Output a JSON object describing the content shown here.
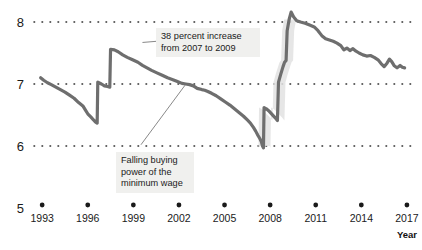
{
  "chart_data": {
    "type": "line",
    "title": "",
    "xlabel": "Year",
    "ylabel": "",
    "xlim": [
      1992.2,
      2017.4
    ],
    "ylim": [
      5,
      8.35
    ],
    "grid": true,
    "grid_style": "dotted-horizontal",
    "legend": "none",
    "line_color": "#6e6e6e",
    "shade_color": "#e2e2e2",
    "y_ticks": [
      "8",
      "7",
      "6",
      "5"
    ],
    "y_tick_values": [
      8,
      7,
      6,
      5
    ],
    "x_ticks": [
      "1993",
      "1996",
      "1999",
      "2002",
      "2005",
      "2008",
      "2011",
      "2014",
      "2017"
    ],
    "x_tick_values": [
      1993,
      1996,
      1999,
      2002,
      2005,
      2008,
      2011,
      2014,
      2017
    ],
    "annotations": [
      {
        "id": "increase",
        "text": "38 percent increase\nfrom 2007 to 2009",
        "leader_from": [
          1999.6,
          7.67
        ],
        "leader_to": [
          2007.0,
          7.82
        ]
      },
      {
        "id": "falling",
        "text": "Falling buying\npower of the\nminimum wage",
        "leader_from": [
          1999.5,
          6.02
        ],
        "leader_to": [
          2002.4,
          6.98
        ]
      }
    ],
    "series": [
      {
        "name": "Real value of federal minimum wage (2017 dollars)",
        "points": [
          [
            1992.9,
            7.1
          ],
          [
            1993.1,
            7.06
          ],
          [
            1993.35,
            7.02
          ],
          [
            1993.6,
            6.99
          ],
          [
            1993.9,
            6.95
          ],
          [
            1994.2,
            6.91
          ],
          [
            1994.5,
            6.87
          ],
          [
            1994.8,
            6.82
          ],
          [
            1995.1,
            6.77
          ],
          [
            1995.4,
            6.7
          ],
          [
            1995.7,
            6.64
          ],
          [
            1995.85,
            6.58
          ],
          [
            1996.0,
            6.52
          ],
          [
            1996.2,
            6.47
          ],
          [
            1996.38,
            6.42
          ],
          [
            1996.5,
            6.39
          ],
          [
            1996.62,
            6.37
          ],
          [
            1996.66,
            7.03
          ],
          [
            1996.9,
            7.0
          ],
          [
            1997.1,
            6.97
          ],
          [
            1997.3,
            6.96
          ],
          [
            1997.45,
            6.95
          ],
          [
            1997.5,
            7.56
          ],
          [
            1997.75,
            7.55
          ],
          [
            1998.0,
            7.52
          ],
          [
            1998.3,
            7.47
          ],
          [
            1998.6,
            7.43
          ],
          [
            1998.95,
            7.39
          ],
          [
            1999.3,
            7.35
          ],
          [
            1999.6,
            7.3
          ],
          [
            1999.9,
            7.26
          ],
          [
            2000.2,
            7.22
          ],
          [
            2000.55,
            7.18
          ],
          [
            2000.9,
            7.14
          ],
          [
            2001.25,
            7.1
          ],
          [
            2001.6,
            7.07
          ],
          [
            2001.9,
            7.04
          ],
          [
            2002.2,
            7.01
          ],
          [
            2002.45,
            7.0
          ],
          [
            2002.7,
            6.99
          ],
          [
            2002.95,
            6.97
          ],
          [
            2003.2,
            6.93
          ],
          [
            2003.5,
            6.91
          ],
          [
            2003.7,
            6.9
          ],
          [
            2003.9,
            6.88
          ],
          [
            2004.15,
            6.85
          ],
          [
            2004.45,
            6.81
          ],
          [
            2004.75,
            6.76
          ],
          [
            2005.05,
            6.71
          ],
          [
            2005.35,
            6.66
          ],
          [
            2005.65,
            6.6
          ],
          [
            2005.95,
            6.54
          ],
          [
            2006.25,
            6.48
          ],
          [
            2006.5,
            6.42
          ],
          [
            2006.7,
            6.37
          ],
          [
            2006.9,
            6.3
          ],
          [
            2007.05,
            6.24
          ],
          [
            2007.2,
            6.17
          ],
          [
            2007.32,
            6.12
          ],
          [
            2007.42,
            6.07
          ],
          [
            2007.5,
            6.0
          ],
          [
            2007.56,
            5.97
          ],
          [
            2007.6,
            6.62
          ],
          [
            2007.75,
            6.6
          ],
          [
            2007.9,
            6.57
          ],
          [
            2008.05,
            6.53
          ],
          [
            2008.2,
            6.49
          ],
          [
            2008.35,
            6.45
          ],
          [
            2008.48,
            6.41
          ],
          [
            2008.55,
            7.03
          ],
          [
            2008.7,
            7.16
          ],
          [
            2008.85,
            7.28
          ],
          [
            2008.95,
            7.35
          ],
          [
            2009.05,
            7.38
          ],
          [
            2009.12,
            7.86
          ],
          [
            2009.25,
            8.04
          ],
          [
            2009.38,
            8.16
          ],
          [
            2009.55,
            8.08
          ],
          [
            2009.75,
            8.02
          ],
          [
            2010.0,
            8.0
          ],
          [
            2010.3,
            7.98
          ],
          [
            2010.6,
            7.95
          ],
          [
            2010.9,
            7.92
          ],
          [
            2011.15,
            7.86
          ],
          [
            2011.4,
            7.78
          ],
          [
            2011.65,
            7.73
          ],
          [
            2011.9,
            7.71
          ],
          [
            2012.15,
            7.69
          ],
          [
            2012.4,
            7.66
          ],
          [
            2012.65,
            7.62
          ],
          [
            2012.85,
            7.55
          ],
          [
            2013.05,
            7.58
          ],
          [
            2013.25,
            7.54
          ],
          [
            2013.45,
            7.57
          ],
          [
            2013.65,
            7.53
          ],
          [
            2013.85,
            7.5
          ],
          [
            2014.1,
            7.47
          ],
          [
            2014.35,
            7.45
          ],
          [
            2014.6,
            7.46
          ],
          [
            2014.85,
            7.43
          ],
          [
            2015.1,
            7.39
          ],
          [
            2015.3,
            7.33
          ],
          [
            2015.5,
            7.28
          ],
          [
            2015.7,
            7.34
          ],
          [
            2015.85,
            7.4
          ],
          [
            2016.0,
            7.36
          ],
          [
            2016.15,
            7.3
          ],
          [
            2016.35,
            7.26
          ],
          [
            2016.55,
            7.3
          ],
          [
            2016.7,
            7.27
          ],
          [
            2016.85,
            7.26
          ]
        ]
      }
    ],
    "shaded_region": {
      "description": "highlight band behind 2007-2009 wage increase",
      "x_start": 2007.45,
      "x_end": 2009.35
    }
  }
}
